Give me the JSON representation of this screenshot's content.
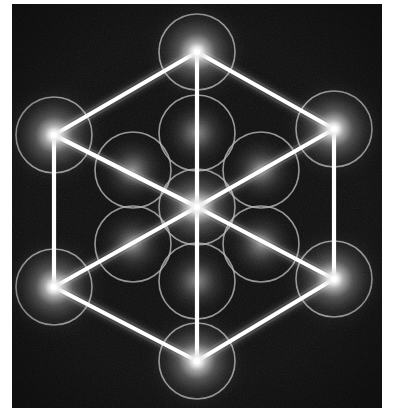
{
  "image": {
    "title": "Metatron's Cube",
    "subject": "sacred-geometry-diagram",
    "description": "Glowing cube-in-hexagon (isometric cube) overlaid on thirteen circles of the Fruit of Life",
    "width": 393,
    "height": 415
  },
  "canvas": {
    "frame": {
      "x": 12,
      "y": 4,
      "width": 370,
      "height": 404
    },
    "background_color": "#0d0d0d",
    "border_color": "#ffffff",
    "grain": "film-noise"
  },
  "colors": {
    "background": "#0d0d0d",
    "line_stroke": "#ffffff",
    "circle_stroke": "#b4b4b4",
    "node_glow_core": "#ffffff",
    "node_glow_mid": "#d8d8d8",
    "diffuse_glow": "#9a9a9a",
    "page_background": "#ffffff"
  },
  "geometry": {
    "center": {
      "x": 185,
      "y": 203
    },
    "hex_radius": 158,
    "circle_radius": 38,
    "line_width": 4.2,
    "circle_stroke_width": 1.6
  },
  "chart_data": {
    "type": "scatter",
    "xlabel": "",
    "ylabel": "",
    "xlim": [
      0,
      370
    ],
    "ylim": [
      0,
      404
    ],
    "grid": false,
    "legend": "none",
    "nodes": [
      {
        "id": "hex-top",
        "label": "Hexagon vertex - top",
        "x": 185,
        "y": 48,
        "glow": "bright",
        "circle": true
      },
      {
        "id": "hex-upper-right",
        "label": "Hexagon vertex - upper right",
        "x": 322,
        "y": 125,
        "glow": "bright",
        "circle": true
      },
      {
        "id": "hex-lower-right",
        "label": "Hexagon vertex - lower right",
        "x": 322,
        "y": 275,
        "glow": "bright",
        "circle": true
      },
      {
        "id": "hex-bottom",
        "label": "Hexagon vertex - bottom",
        "x": 185,
        "y": 357,
        "glow": "bright",
        "circle": true
      },
      {
        "id": "hex-lower-left",
        "label": "Hexagon vertex - lower left",
        "x": 42,
        "y": 283,
        "glow": "bright",
        "circle": true
      },
      {
        "id": "hex-upper-left",
        "label": "Hexagon vertex - upper left",
        "x": 42,
        "y": 131,
        "glow": "bright",
        "circle": true
      },
      {
        "id": "core-center",
        "label": "Central node",
        "x": 185,
        "y": 203,
        "glow": "bright",
        "circle": true
      },
      {
        "id": "inner-top",
        "label": "Inner circle - top",
        "x": 185,
        "y": 129,
        "glow": "diffuse",
        "circle": true
      },
      {
        "id": "inner-upper-right",
        "label": "Inner circle - upper right",
        "x": 249,
        "y": 166,
        "glow": "diffuse",
        "circle": true
      },
      {
        "id": "inner-lower-right",
        "label": "Inner circle - lower right",
        "x": 249,
        "y": 240,
        "glow": "diffuse",
        "circle": true
      },
      {
        "id": "inner-bottom",
        "label": "Inner circle - bottom",
        "x": 185,
        "y": 277,
        "glow": "diffuse",
        "circle": true
      },
      {
        "id": "inner-lower-left",
        "label": "Inner circle - lower left",
        "x": 121,
        "y": 240,
        "glow": "diffuse",
        "circle": true
      },
      {
        "id": "inner-upper-left",
        "label": "Inner circle - upper left",
        "x": 121,
        "y": 166,
        "glow": "diffuse",
        "circle": true
      }
    ],
    "edges": [
      {
        "id": "hex-edge-1",
        "label": "Hexagon edge top to upper-right",
        "from": "hex-top",
        "to": "hex-upper-right"
      },
      {
        "id": "hex-edge-2",
        "label": "Hexagon edge upper-right to lower-right",
        "from": "hex-upper-right",
        "to": "hex-lower-right"
      },
      {
        "id": "hex-edge-3",
        "label": "Hexagon edge lower-right to bottom",
        "from": "hex-lower-right",
        "to": "hex-bottom"
      },
      {
        "id": "hex-edge-4",
        "label": "Hexagon edge bottom to lower-left",
        "from": "hex-bottom",
        "to": "hex-lower-left"
      },
      {
        "id": "hex-edge-5",
        "label": "Hexagon edge lower-left to upper-left",
        "from": "hex-lower-left",
        "to": "hex-upper-left"
      },
      {
        "id": "hex-edge-6",
        "label": "Hexagon edge upper-left to top",
        "from": "hex-upper-left",
        "to": "hex-top"
      },
      {
        "id": "spoke-top",
        "label": "Cube edge center to top",
        "from": "core-center",
        "to": "hex-top"
      },
      {
        "id": "spoke-bottom",
        "label": "Cube edge center to bottom",
        "from": "core-center",
        "to": "hex-bottom"
      },
      {
        "id": "diag-ul",
        "label": "Cube edge center to upper-left",
        "from": "core-center",
        "to": "hex-upper-left"
      },
      {
        "id": "diag-ur",
        "label": "Cube edge center to upper-right",
        "from": "core-center",
        "to": "hex-upper-right"
      },
      {
        "id": "diag-ll",
        "label": "Cube edge center to lower-left",
        "from": "core-center",
        "to": "hex-lower-left"
      },
      {
        "id": "diag-lr",
        "label": "Cube edge center to lower-right",
        "from": "core-center",
        "to": "hex-lower-right"
      }
    ],
    "counts": {
      "circles": 13,
      "bright_nodes": 7,
      "diffuse_nodes": 6,
      "edges": 12
    }
  }
}
